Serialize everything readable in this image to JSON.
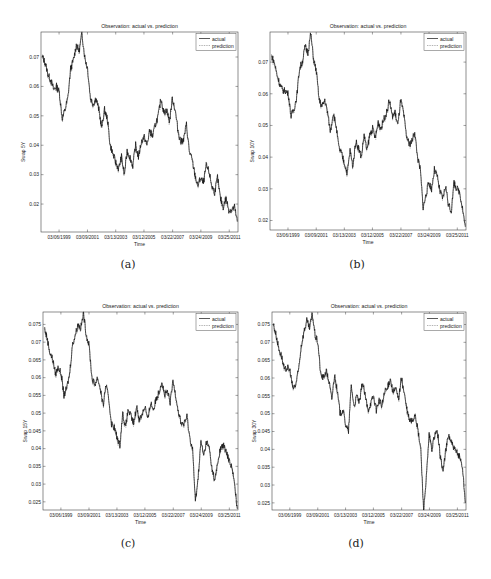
{
  "figure": {
    "captions": [
      "(a)",
      "(b)",
      "(c)",
      "(d)"
    ]
  },
  "chart_data": [
    {
      "type": "line",
      "title": "Observation: actual vs. prediction",
      "xlabel": "Time",
      "ylabel": "Swap 5Y",
      "xticks": [
        "03/06/1999",
        "03/09/2001",
        "03/13/2003",
        "03/12/2005",
        "03/22/2007",
        "03/24/2009",
        "03/25/2011"
      ],
      "yticks": [
        0.02,
        0.03,
        0.04,
        0.05,
        0.06,
        0.07
      ],
      "ytick_labels": [
        "0.02",
        "0.03",
        "0.04",
        "0.05",
        "0.06",
        "0.07"
      ],
      "ylim": [
        0.0105,
        0.0785
      ],
      "xlim": [
        "1998-01",
        "2011-10"
      ],
      "grid": false,
      "legend": {
        "position": "upper right",
        "entries": [
          "actual",
          "prediction"
        ]
      },
      "series": [
        {
          "name": "actual",
          "style": "solid",
          "color": "#000000",
          "x": [
            1998.0,
            1998.2,
            1998.4,
            1998.6,
            1998.8,
            1999.0,
            1999.2,
            1999.4,
            1999.6,
            1999.8,
            2000.0,
            2000.2,
            2000.4,
            2000.6,
            2000.8,
            2001.0,
            2001.2,
            2001.4,
            2001.6,
            2001.8,
            2002.0,
            2002.2,
            2002.4,
            2002.6,
            2002.8,
            2003.0,
            2003.2,
            2003.4,
            2003.6,
            2003.8,
            2004.0,
            2004.2,
            2004.4,
            2004.6,
            2004.8,
            2005.0,
            2005.2,
            2005.4,
            2005.6,
            2005.8,
            2006.0,
            2006.2,
            2006.4,
            2006.6,
            2006.8,
            2007.0,
            2007.2,
            2007.4,
            2007.6,
            2007.8,
            2008.0,
            2008.2,
            2008.4,
            2008.6,
            2008.8,
            2009.0,
            2009.2,
            2009.4,
            2009.6,
            2009.8,
            2010.0,
            2010.2,
            2010.4,
            2010.6,
            2010.8,
            2011.0,
            2011.2,
            2011.4,
            2011.6,
            2011.8
          ],
          "values": [
            0.07,
            0.068,
            0.064,
            0.062,
            0.059,
            0.06,
            0.058,
            0.049,
            0.052,
            0.056,
            0.066,
            0.069,
            0.074,
            0.072,
            0.078,
            0.07,
            0.066,
            0.056,
            0.054,
            0.056,
            0.052,
            0.046,
            0.052,
            0.049,
            0.04,
            0.037,
            0.034,
            0.032,
            0.036,
            0.03,
            0.038,
            0.036,
            0.033,
            0.04,
            0.036,
            0.041,
            0.043,
            0.04,
            0.045,
            0.043,
            0.047,
            0.05,
            0.056,
            0.051,
            0.052,
            0.048,
            0.056,
            0.052,
            0.045,
            0.041,
            0.042,
            0.047,
            0.038,
            0.035,
            0.03,
            0.026,
            0.029,
            0.027,
            0.033,
            0.031,
            0.026,
            0.024,
            0.029,
            0.022,
            0.019,
            0.022,
            0.018,
            0.018,
            0.019,
            0.014
          ]
        },
        {
          "name": "prediction",
          "style": "dotted",
          "color": "#555555"
        }
      ]
    },
    {
      "type": "line",
      "title": "Observation: actual vs. prediction",
      "xlabel": "Time",
      "ylabel": "Swap 10Y",
      "xticks": [
        "03/06/1999",
        "03/09/2001",
        "03/13/2003",
        "03/12/2005",
        "03/22/2007",
        "03/24/2009",
        "03/25/2011"
      ],
      "yticks": [
        0.02,
        0.03,
        0.04,
        0.05,
        0.06,
        0.07
      ],
      "ytick_labels": [
        "0.02",
        "0.03",
        "0.04",
        "0.05",
        "0.06",
        "0.07"
      ],
      "ylim": [
        0.017,
        0.0795
      ],
      "xlim": [
        "1998-01",
        "2011-10"
      ],
      "grid": false,
      "legend": {
        "position": "upper right",
        "entries": [
          "actual",
          "prediction"
        ]
      },
      "series": [
        {
          "name": "actual",
          "style": "solid",
          "color": "#000000",
          "x": [
            1998.0,
            1998.2,
            1998.4,
            1998.6,
            1998.8,
            1999.0,
            1999.2,
            1999.4,
            1999.6,
            1999.8,
            2000.0,
            2000.2,
            2000.4,
            2000.6,
            2000.8,
            2001.0,
            2001.2,
            2001.4,
            2001.6,
            2001.8,
            2002.0,
            2002.2,
            2002.4,
            2002.6,
            2002.8,
            2003.0,
            2003.2,
            2003.4,
            2003.6,
            2003.8,
            2004.0,
            2004.2,
            2004.4,
            2004.6,
            2004.8,
            2005.0,
            2005.2,
            2005.4,
            2005.6,
            2005.8,
            2006.0,
            2006.2,
            2006.4,
            2006.6,
            2006.8,
            2007.0,
            2007.2,
            2007.4,
            2007.6,
            2007.8,
            2008.0,
            2008.2,
            2008.4,
            2008.6,
            2008.8,
            2009.0,
            2009.2,
            2009.4,
            2009.6,
            2009.8,
            2010.0,
            2010.2,
            2010.4,
            2010.6,
            2010.8,
            2011.0,
            2011.2,
            2011.4,
            2011.6,
            2011.8
          ],
          "values": [
            0.072,
            0.07,
            0.066,
            0.063,
            0.061,
            0.061,
            0.06,
            0.053,
            0.055,
            0.059,
            0.068,
            0.07,
            0.075,
            0.073,
            0.079,
            0.071,
            0.067,
            0.058,
            0.056,
            0.058,
            0.054,
            0.048,
            0.054,
            0.05,
            0.043,
            0.041,
            0.038,
            0.035,
            0.042,
            0.037,
            0.045,
            0.043,
            0.04,
            0.047,
            0.042,
            0.047,
            0.049,
            0.046,
            0.051,
            0.049,
            0.052,
            0.054,
            0.058,
            0.053,
            0.054,
            0.05,
            0.058,
            0.054,
            0.047,
            0.044,
            0.045,
            0.048,
            0.04,
            0.036,
            0.024,
            0.028,
            0.032,
            0.03,
            0.036,
            0.034,
            0.029,
            0.027,
            0.031,
            0.025,
            0.023,
            0.032,
            0.03,
            0.029,
            0.024,
            0.018
          ]
        },
        {
          "name": "prediction",
          "style": "dotted",
          "color": "#555555"
        }
      ]
    },
    {
      "type": "line",
      "title": "Observation: actual vs. prediction",
      "xlabel": "Time",
      "ylabel": "Swap 15Y",
      "xticks": [
        "03/06/1999",
        "03/09/2001",
        "03/13/2003",
        "03/12/2005",
        "03/22/2007",
        "03/24/2009",
        "03/25/2011"
      ],
      "yticks": [
        0.025,
        0.03,
        0.035,
        0.04,
        0.045,
        0.05,
        0.055,
        0.06,
        0.065,
        0.07,
        0.075
      ],
      "ytick_labels": [
        "0.025",
        "0.03",
        "0.035",
        "0.04",
        "0.045",
        "0.05",
        "0.055",
        "0.06",
        "0.065",
        "0.07",
        "0.075"
      ],
      "ylim": [
        0.0227,
        0.0785
      ],
      "xlim": [
        "1998-01",
        "2011-10"
      ],
      "grid": false,
      "legend": {
        "position": "upper right",
        "entries": [
          "actual",
          "prediction"
        ]
      },
      "series": [
        {
          "name": "actual",
          "style": "solid",
          "color": "#000000",
          "x": [
            1998.0,
            1998.2,
            1998.4,
            1998.6,
            1998.8,
            1999.0,
            1999.2,
            1999.4,
            1999.6,
            1999.8,
            2000.0,
            2000.2,
            2000.4,
            2000.6,
            2000.8,
            2001.0,
            2001.2,
            2001.4,
            2001.6,
            2001.8,
            2002.0,
            2002.2,
            2002.4,
            2002.6,
            2002.8,
            2003.0,
            2003.2,
            2003.4,
            2003.6,
            2003.8,
            2004.0,
            2004.2,
            2004.4,
            2004.6,
            2004.8,
            2005.0,
            2005.2,
            2005.4,
            2005.6,
            2005.8,
            2006.0,
            2006.2,
            2006.4,
            2006.6,
            2006.8,
            2007.0,
            2007.2,
            2007.4,
            2007.6,
            2007.8,
            2008.0,
            2008.2,
            2008.4,
            2008.6,
            2008.8,
            2009.0,
            2009.2,
            2009.4,
            2009.6,
            2009.8,
            2010.0,
            2010.2,
            2010.4,
            2010.6,
            2010.8,
            2011.0,
            2011.2,
            2011.4,
            2011.6,
            2011.8
          ],
          "values": [
            0.074,
            0.071,
            0.067,
            0.065,
            0.061,
            0.063,
            0.061,
            0.055,
            0.057,
            0.061,
            0.069,
            0.072,
            0.075,
            0.074,
            0.078,
            0.072,
            0.069,
            0.06,
            0.058,
            0.06,
            0.057,
            0.052,
            0.058,
            0.054,
            0.047,
            0.046,
            0.043,
            0.041,
            0.05,
            0.046,
            0.051,
            0.049,
            0.047,
            0.052,
            0.048,
            0.05,
            0.052,
            0.048,
            0.053,
            0.051,
            0.054,
            0.056,
            0.059,
            0.055,
            0.056,
            0.053,
            0.059,
            0.055,
            0.05,
            0.047,
            0.047,
            0.049,
            0.043,
            0.04,
            0.025,
            0.032,
            0.042,
            0.038,
            0.042,
            0.04,
            0.034,
            0.031,
            0.036,
            0.04,
            0.041,
            0.039,
            0.037,
            0.035,
            0.03,
            0.023
          ]
        },
        {
          "name": "prediction",
          "style": "dotted",
          "color": "#555555"
        }
      ]
    },
    {
      "type": "line",
      "title": "Observation: actual vs. prediction",
      "xlabel": "Time",
      "ylabel": "Swap 30Y",
      "xticks": [
        "03/06/1999",
        "03/09/2001",
        "03/13/2003",
        "03/12/2005",
        "03/22/2007",
        "03/24/2009",
        "03/25/2011"
      ],
      "yticks": [
        0.025,
        0.03,
        0.035,
        0.04,
        0.045,
        0.05,
        0.055,
        0.06,
        0.065,
        0.07,
        0.075
      ],
      "ytick_labels": [
        "0.025",
        "0.03",
        "0.035",
        "0.04",
        "0.045",
        "0.05",
        "0.055",
        "0.06",
        "0.065",
        "0.07",
        "0.075"
      ],
      "ylim": [
        0.023,
        0.0785
      ],
      "xlim": [
        "1998-01",
        "2011-10"
      ],
      "grid": false,
      "legend": {
        "position": "upper right",
        "entries": [
          "actual",
          "prediction"
        ]
      },
      "series": [
        {
          "name": "actual",
          "style": "solid",
          "color": "#000000",
          "x": [
            1998.0,
            1998.2,
            1998.4,
            1998.6,
            1998.8,
            1999.0,
            1999.2,
            1999.4,
            1999.6,
            1999.8,
            2000.0,
            2000.2,
            2000.4,
            2000.6,
            2000.8,
            2001.0,
            2001.2,
            2001.4,
            2001.6,
            2001.8,
            2002.0,
            2002.2,
            2002.4,
            2002.6,
            2002.8,
            2003.0,
            2003.2,
            2003.4,
            2003.6,
            2003.8,
            2004.0,
            2004.2,
            2004.4,
            2004.6,
            2004.8,
            2005.0,
            2005.2,
            2005.4,
            2005.6,
            2005.8,
            2006.0,
            2006.2,
            2006.4,
            2006.6,
            2006.8,
            2007.0,
            2007.2,
            2007.4,
            2007.6,
            2007.8,
            2008.0,
            2008.2,
            2008.4,
            2008.6,
            2008.8,
            2009.0,
            2009.2,
            2009.4,
            2009.6,
            2009.8,
            2010.0,
            2010.2,
            2010.4,
            2010.6,
            2010.8,
            2011.0,
            2011.2,
            2011.4,
            2011.6,
            2011.8
          ],
          "values": [
            0.075,
            0.072,
            0.068,
            0.066,
            0.062,
            0.063,
            0.062,
            0.057,
            0.058,
            0.062,
            0.069,
            0.073,
            0.076,
            0.074,
            0.078,
            0.072,
            0.07,
            0.061,
            0.06,
            0.062,
            0.059,
            0.054,
            0.061,
            0.056,
            0.05,
            0.051,
            0.047,
            0.045,
            0.058,
            0.052,
            0.055,
            0.053,
            0.059,
            0.055,
            0.051,
            0.053,
            0.055,
            0.051,
            0.054,
            0.052,
            0.056,
            0.057,
            0.06,
            0.056,
            0.057,
            0.054,
            0.06,
            0.056,
            0.051,
            0.048,
            0.048,
            0.05,
            0.045,
            0.04,
            0.023,
            0.032,
            0.044,
            0.04,
            0.044,
            0.045,
            0.038,
            0.034,
            0.04,
            0.044,
            0.042,
            0.04,
            0.039,
            0.038,
            0.035,
            0.025
          ]
        },
        {
          "name": "prediction",
          "style": "dotted",
          "color": "#555555"
        }
      ]
    }
  ]
}
